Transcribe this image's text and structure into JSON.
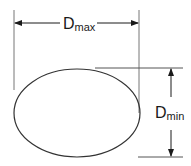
{
  "diagram": {
    "labels": {
      "max": {
        "main": "D",
        "sub": "max"
      },
      "min": {
        "main": "D",
        "sub": "min"
      }
    },
    "shape": "ellipse",
    "colors": {
      "stroke": "#333333",
      "guide": "#555555",
      "background": "#ffffff"
    }
  }
}
